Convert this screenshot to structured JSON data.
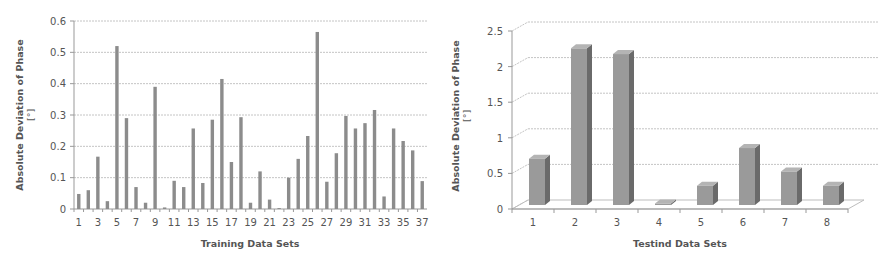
{
  "chart_data": [
    {
      "type": "bar",
      "title": "",
      "xlabel": "Training Data Sets",
      "ylabel": "Absolute Deviation of Phase",
      "ylabel_unit": "[°]",
      "ylim": [
        0,
        0.6
      ],
      "yticks": [
        "0",
        "0.1",
        "0.2",
        "0.3",
        "0.4",
        "0.5",
        "0.6"
      ],
      "ytick_values": [
        0,
        0.1,
        0.2,
        0.3,
        0.4,
        0.5,
        0.6
      ],
      "categories": [
        1,
        2,
        3,
        4,
        5,
        6,
        7,
        8,
        9,
        10,
        11,
        12,
        13,
        14,
        15,
        16,
        17,
        18,
        19,
        20,
        21,
        22,
        23,
        24,
        25,
        26,
        27,
        28,
        29,
        30,
        31,
        32,
        33,
        34,
        35,
        36,
        37
      ],
      "xtick_labels_shown": [
        "1",
        "3",
        "5",
        "7",
        "9",
        "11",
        "13",
        "15",
        "17",
        "19",
        "21",
        "23",
        "25",
        "27",
        "29",
        "31",
        "33",
        "35",
        "37"
      ],
      "values": [
        0.048,
        0.06,
        0.167,
        0.025,
        0.52,
        0.29,
        0.07,
        0.02,
        0.39,
        0.005,
        0.09,
        0.07,
        0.257,
        0.083,
        0.285,
        0.415,
        0.15,
        0.293,
        0.02,
        0.12,
        0.03,
        0.003,
        0.1,
        0.16,
        0.233,
        0.565,
        0.087,
        0.178,
        0.297,
        0.257,
        0.274,
        0.316,
        0.04,
        0.257,
        0.217,
        0.187,
        0.089
      ],
      "grid": true,
      "legend": null,
      "bar_color": "#8c8c8c"
    },
    {
      "type": "bar",
      "style": "3d-column",
      "title": "",
      "xlabel": "Testind Data Sets",
      "ylabel": "Absolute Deviation of Phase",
      "ylabel_unit": "[°]",
      "ylim": [
        0,
        2.5
      ],
      "yticks": [
        "0",
        "0.5",
        "1",
        "1.5",
        "2",
        "2.5"
      ],
      "ytick_values": [
        0,
        0.5,
        1,
        1.5,
        2,
        2.5
      ],
      "categories": [
        "1",
        "2",
        "3",
        "4",
        "5",
        "6",
        "7",
        "8"
      ],
      "values": [
        0.65,
        2.2,
        2.12,
        0.02,
        0.27,
        0.8,
        0.47,
        0.27
      ],
      "grid": true,
      "legend": null,
      "bar_color": "#9a9a9a",
      "bar_side_color": "#6a6a6a",
      "bar_top_color": "#b4b4b4"
    }
  ]
}
